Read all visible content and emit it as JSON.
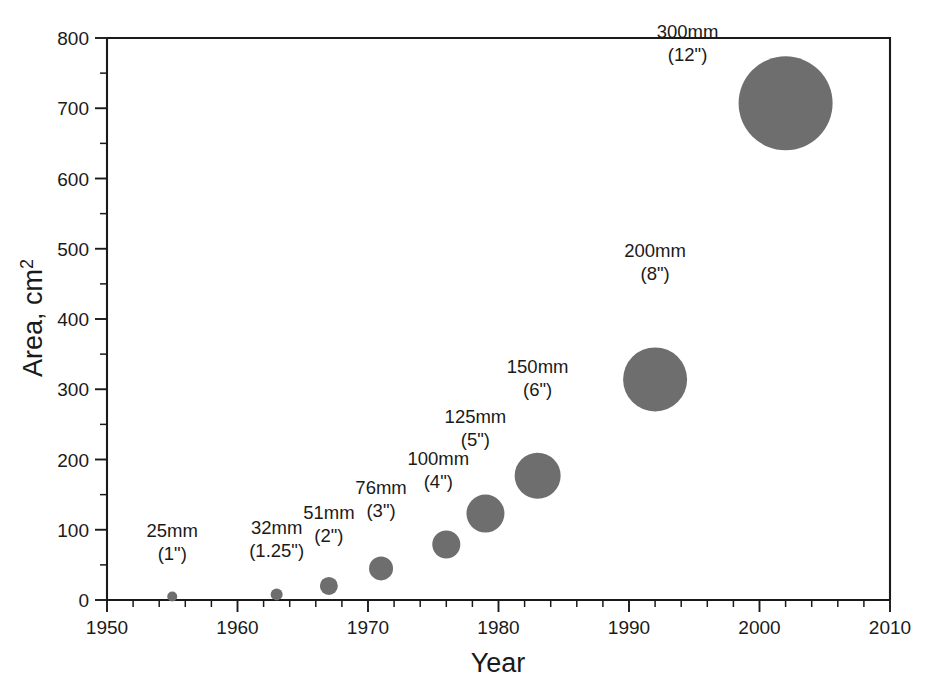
{
  "chart_data": {
    "type": "scatter",
    "title": "",
    "subtitle": "",
    "xlabel": "Year",
    "ylabel": "Area, cm2",
    "ylabel_display": "Area, cm",
    "ylabel_superscript": "2",
    "xlim": [
      1950,
      2010
    ],
    "ylim": [
      0,
      800
    ],
    "x_major_ticks": [
      1950,
      1960,
      1970,
      1980,
      1990,
      2000,
      2010
    ],
    "x_tick_labels": [
      "1950",
      "1960",
      "1970",
      "1980",
      "1990",
      "2000",
      "2010"
    ],
    "x_minor_step": 2,
    "y_major_ticks": [
      0,
      100,
      200,
      300,
      400,
      500,
      600,
      700,
      800
    ],
    "y_tick_labels": [
      "0",
      "100",
      "200",
      "300",
      "400",
      "500",
      "600",
      "700",
      "800"
    ],
    "y_minor_step": 50,
    "grid": false,
    "legend": "none",
    "marker_color": "#6e6e6e",
    "axis_color": "#1a1a1a",
    "background": "#ffffff",
    "size_encoding": "marker radius proportional to wafer diameter",
    "points": [
      {
        "name": "25mm",
        "label_mm": "25mm",
        "label_in": "(1\")",
        "x": 1955,
        "y": 5,
        "diameter_mm": 25,
        "diameter_in": 1,
        "marker_r": 5,
        "label_dx": 0,
        "label_dy": -54,
        "label_anchor": "middle"
      },
      {
        "name": "32mm",
        "label_mm": "32mm",
        "label_in": "(1.25\")",
        "x": 1963,
        "y": 8,
        "diameter_mm": 32,
        "diameter_in": 1.25,
        "marker_r": 6,
        "label_dx": 0,
        "label_dy": -54,
        "label_anchor": "middle"
      },
      {
        "name": "51mm",
        "label_mm": "51mm",
        "label_in": "(2\")",
        "x": 1967,
        "y": 20,
        "diameter_mm": 51,
        "diameter_in": 2,
        "marker_r": 9,
        "label_dx": 0,
        "label_dy": -58,
        "label_anchor": "middle"
      },
      {
        "name": "76mm",
        "label_mm": "76mm",
        "label_in": "(3\")",
        "x": 1971,
        "y": 45,
        "diameter_mm": 76,
        "diameter_in": 3,
        "marker_r": 12,
        "label_dx": 0,
        "label_dy": -62,
        "label_anchor": "middle"
      },
      {
        "name": "100mm",
        "label_mm": "100mm",
        "label_in": "(4\")",
        "x": 1976,
        "y": 79,
        "diameter_mm": 100,
        "diameter_in": 4,
        "marker_r": 14,
        "label_dx": -8,
        "label_dy": -66,
        "label_anchor": "middle"
      },
      {
        "name": "125mm",
        "label_mm": "125mm",
        "label_in": "(5\")",
        "x": 1979,
        "y": 123,
        "diameter_mm": 125,
        "diameter_in": 5,
        "marker_r": 19,
        "label_dx": -10,
        "label_dy": -72,
        "label_anchor": "middle"
      },
      {
        "name": "150mm",
        "label_mm": "150mm",
        "label_in": "(6\")",
        "x": 1983,
        "y": 177,
        "diameter_mm": 150,
        "diameter_in": 6,
        "marker_r": 23,
        "label_dx": 0,
        "label_dy": -80,
        "label_anchor": "middle"
      },
      {
        "name": "200mm",
        "label_mm": "200mm",
        "label_in": "(8\")",
        "x": 1992,
        "y": 314,
        "diameter_mm": 200,
        "diameter_in": 8,
        "marker_r": 32,
        "label_dx": 0,
        "label_dy": -90,
        "label_anchor": "middle"
      },
      {
        "name": "300mm",
        "label_mm": "300mm",
        "label_in": "(12\")",
        "x": 2002,
        "y": 707,
        "diameter_mm": 300,
        "diameter_in": 12,
        "marker_r": 47,
        "label_dx": -98,
        "label_dy": -18,
        "label_anchor": "middle"
      }
    ]
  }
}
